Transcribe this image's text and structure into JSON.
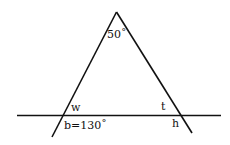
{
  "diagram": {
    "type": "geometry-triangle-with-transversal",
    "colors": {
      "line": "#111111",
      "background": "#ffffff"
    },
    "labels": {
      "apex_angle": "50˚",
      "w": "w",
      "t": "t",
      "h": "h",
      "b": "b=130˚"
    }
  }
}
